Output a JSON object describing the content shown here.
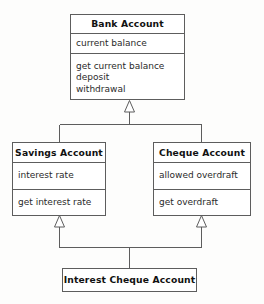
{
  "diagram": {
    "type": "uml-class-diagram",
    "relationship_type": "generalization",
    "classes": [
      {
        "id": "bank-account",
        "name": "Bank Account",
        "attributes": [
          "current balance"
        ],
        "operations": [
          "get current balance",
          "deposit",
          "withdrawal"
        ]
      },
      {
        "id": "savings-account",
        "name": "Savings Account",
        "attributes": [
          "interest rate"
        ],
        "operations": [
          "get interest rate"
        ]
      },
      {
        "id": "cheque-account",
        "name": "Cheque Account",
        "attributes": [
          "allowed overdraft"
        ],
        "operations": [
          "get overdraft"
        ]
      },
      {
        "id": "interest-cheque-account",
        "name": "Interest Cheque Account",
        "attributes": [],
        "operations": []
      }
    ],
    "generalizations": [
      {
        "from": "savings-account",
        "to": "bank-account"
      },
      {
        "from": "cheque-account",
        "to": "bank-account"
      },
      {
        "from": "interest-cheque-account",
        "to": "savings-account"
      },
      {
        "from": "interest-cheque-account",
        "to": "cheque-account"
      }
    ],
    "colors": {
      "line": "#5d5d5d",
      "box_fill": "#ffffff",
      "text": "#111111",
      "background": "#fdfdfc"
    }
  }
}
